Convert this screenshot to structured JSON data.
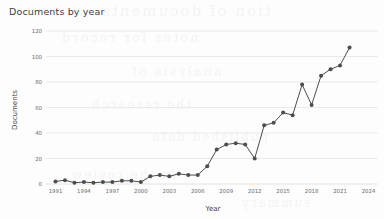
{
  "chart_data": {
    "type": "line",
    "title": "Documents by year",
    "xlabel": "Year",
    "ylabel": "Documents",
    "grid": true,
    "legend": false,
    "xlim": [
      1990,
      2025
    ],
    "ylim": [
      0,
      120
    ],
    "ytick_values": [
      0,
      20,
      40,
      60,
      80,
      100,
      120
    ],
    "ytick_labels": [
      "0",
      "20",
      "40",
      "60",
      "80",
      "100",
      "120"
    ],
    "xtick_values": [
      1991,
      1994,
      1997,
      2000,
      2003,
      2006,
      2009,
      2012,
      2015,
      2018,
      2021,
      2024
    ],
    "xtick_labels": [
      "1991",
      "1994",
      "1997",
      "2000",
      "2003",
      "2006",
      "2009",
      "2012",
      "2015",
      "2018",
      "2021",
      "2024"
    ],
    "x": [
      1991,
      1992,
      1993,
      1994,
      1995,
      1996,
      1997,
      1998,
      1999,
      2000,
      2001,
      2002,
      2003,
      2004,
      2005,
      2006,
      2007,
      2008,
      2009,
      2010,
      2011,
      2012,
      2013,
      2014,
      2015,
      2016,
      2017,
      2018,
      2019,
      2020,
      2021,
      2022
    ],
    "values": [
      2,
      3,
      1,
      1.5,
      1,
      1.5,
      1.5,
      2.5,
      2.5,
      1.5,
      6,
      7,
      6,
      8,
      7,
      7,
      14,
      27,
      31,
      32,
      31,
      20,
      46,
      48,
      56,
      54,
      78,
      62,
      85,
      90,
      93,
      107
    ],
    "series_color": "#4d4d4d",
    "marker": "circle",
    "marker_size": 2
  },
  "chart_style": {
    "background": "#fdfdfd",
    "grid_color": "#e4e4e4",
    "tick_label_color": "#6b6b6b",
    "title_color": "#3d3d3d",
    "axis_title_color": "#3d3d3d"
  },
  "watermark": {
    "lines": [
      "tion of documents",
      "notes for record",
      "analysis of",
      "the research",
      "published data",
      "in the review",
      "summary"
    ]
  }
}
